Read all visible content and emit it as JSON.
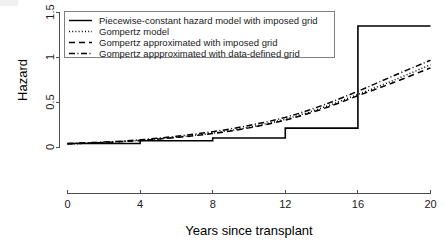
{
  "chart_data": {
    "type": "line",
    "title": "",
    "xlabel": "Years since transplant",
    "ylabel": "Hazard",
    "xlim": [
      0,
      20
    ],
    "ylim": [
      0,
      1.5
    ],
    "xticks": [
      0,
      4,
      8,
      12,
      16,
      20
    ],
    "xtick_labels": [
      "0",
      "4",
      "8",
      "12",
      "16",
      "20"
    ],
    "yticks": [
      0,
      0.5,
      1,
      1.5
    ],
    "ytick_labels": [
      "0",
      "0.5",
      "1",
      "1.5"
    ],
    "grid": false,
    "legend_position": "top-left",
    "series": [
      {
        "name": "Piecewise-constant hazard model with imposed grid",
        "style": "solid",
        "type": "step",
        "x": [
          0,
          4,
          4,
          8,
          8,
          12,
          12,
          16,
          16,
          20
        ],
        "y": [
          0.045,
          0.045,
          0.075,
          0.075,
          0.105,
          0.105,
          0.215,
          0.215,
          1.35,
          1.35
        ]
      },
      {
        "name": "Gompertz model",
        "style": "dotted",
        "type": "smooth",
        "x": [
          0,
          2,
          4,
          6,
          8,
          10,
          12,
          14,
          16,
          18,
          20
        ],
        "y": [
          0.04,
          0.055,
          0.08,
          0.115,
          0.16,
          0.225,
          0.315,
          0.44,
          0.59,
          0.75,
          0.92
        ]
      },
      {
        "name": "Gompertz approximated with imposed grid",
        "style": "dashed",
        "type": "smooth",
        "x": [
          0,
          2,
          4,
          6,
          8,
          10,
          12,
          14,
          16,
          18,
          20
        ],
        "y": [
          0.04,
          0.055,
          0.078,
          0.112,
          0.155,
          0.218,
          0.305,
          0.425,
          0.575,
          0.725,
          0.885
        ]
      },
      {
        "name": "Gompertz appproximated with data-defined grid",
        "style": "dashdot",
        "type": "smooth",
        "x": [
          0,
          2,
          4,
          6,
          8,
          10,
          12,
          14,
          16,
          18,
          20
        ],
        "y": [
          0.045,
          0.06,
          0.085,
          0.125,
          0.175,
          0.245,
          0.335,
          0.465,
          0.625,
          0.8,
          0.97
        ]
      }
    ]
  },
  "axes": {
    "y_title": "Hazard",
    "x_title": "Years since transplant",
    "x_tick_labels": [
      "0",
      "4",
      "8",
      "12",
      "16",
      "20"
    ],
    "y_tick_labels": [
      "0",
      "0.5",
      "1",
      "1.5"
    ]
  },
  "legend": {
    "entries": [
      {
        "label": "Piecewise-constant hazard model with imposed grid",
        "style": "solid"
      },
      {
        "label": "Gompertz model",
        "style": "dotted"
      },
      {
        "label": "Gompertz approximated with imposed grid",
        "style": "dashed"
      },
      {
        "label": "Gompertz appproximated with data-defined grid",
        "style": "dashdot"
      }
    ]
  },
  "colors": {
    "foreground": "#000000",
    "axis": "#4d4d4d",
    "legend_border": "#808080",
    "background": "#ffffff"
  }
}
